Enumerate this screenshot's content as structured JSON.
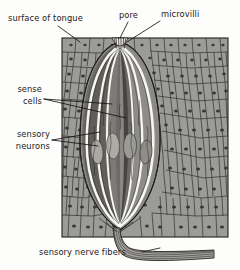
{
  "figure": {
    "background_color": "#fdfdfc",
    "ink_color": "#1b1b1b"
  },
  "labels": {
    "surface_of_tongue": "surface of tongue",
    "pore": "pore",
    "microvilli": "microvilli",
    "sense_cells_line1": "sense",
    "sense_cells_line2": "cells",
    "sensory_neurons_line1": "sensory",
    "sensory_neurons_line2": "neurons",
    "sensory_nerve_fibers": "sensory nerve fibers"
  },
  "palette": {
    "epithelium_fill": "#9b9b99",
    "epithelium_outline": "#23211f",
    "taste_bud_light": "#b4b3af",
    "taste_bud_mid": "#8a8986",
    "taste_bud_dark": "#5d5c59",
    "taste_bud_darkest": "#3f3e3c",
    "highlight": "#f6f5f1",
    "nerve_fill": "#a7a6a2"
  }
}
